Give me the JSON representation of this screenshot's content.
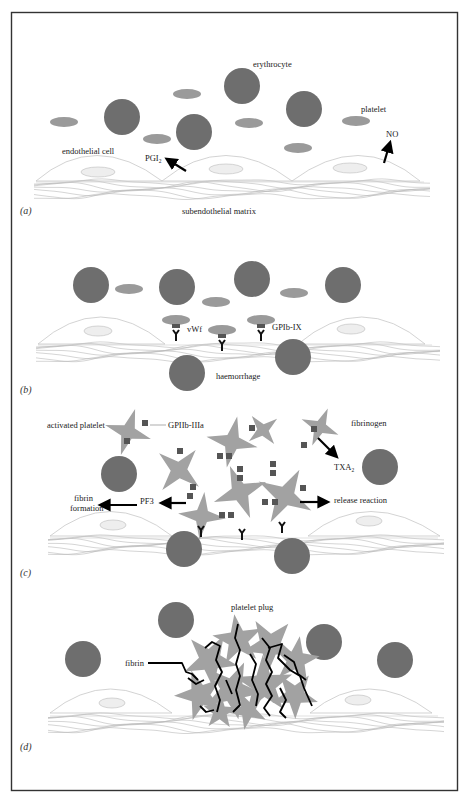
{
  "figure": {
    "colors": {
      "erythrocyte": "#6e6e6e",
      "platelet": "#9a9a9a",
      "activated_platelet": "#a2a2a2",
      "receptor": "#555555",
      "fibrin": "#000000",
      "border": "#333333"
    },
    "panels": [
      {
        "id": "a",
        "label": "(a)",
        "annotations": {
          "erythrocyte": "erythrocyte",
          "platelet": "platelet",
          "endothelial_cell": "endothelial cell",
          "pgi2": "PGI",
          "pgi2_sub": "2",
          "no": "NO",
          "matrix": "subendothelial matrix"
        }
      },
      {
        "id": "b",
        "label": "(b)",
        "annotations": {
          "vwf": "vWf",
          "gpib": "GPIb-IX",
          "haemorrhage": "haemorrhage"
        }
      },
      {
        "id": "c",
        "label": "(c)",
        "annotations": {
          "activated_platelet": "activated platelet",
          "gpiib": "GPIIb-IIIa",
          "fibrinogen": "fibrinogen",
          "txa2": "TXA",
          "txa2_sub": "2",
          "fibrin_formation_1": "fibrin",
          "fibrin_formation_2": "formation",
          "pf3": "PF3",
          "release_reaction": "release reaction"
        }
      },
      {
        "id": "d",
        "label": "(d)",
        "annotations": {
          "platelet_plug": "platelet plug",
          "fibrin": "fibrin"
        }
      }
    ]
  }
}
